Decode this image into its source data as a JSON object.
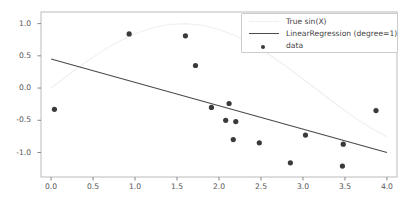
{
  "figure": {
    "top_artifact_text": "",
    "background": "#ffffff"
  },
  "legend": {
    "entries": [
      {
        "label": "True sin(X)",
        "marker": "line",
        "color": "#f2eef2"
      },
      {
        "label": "LinearRegression  (degree=1)",
        "marker": "line",
        "color": "#4a4a4a"
      },
      {
        "label": "data",
        "marker": "dot",
        "color": "#3a3a3a"
      }
    ]
  },
  "axes": {
    "xticks": [
      "0.0",
      "0.5",
      "1.0",
      "1.5",
      "2.0",
      "2.5",
      "3.0",
      "3.5",
      "4.0"
    ],
    "yticks": [
      "1.0",
      "0.5",
      "0.0",
      "-0.5",
      "-1.0"
    ],
    "xlabel": "",
    "ylabel": "",
    "spine_color": "#bbbbbb",
    "tick_color": "#888888"
  },
  "chart_data": {
    "type": "scatter",
    "title": "",
    "xlabel": "",
    "ylabel": "",
    "xlim": [
      -0.12,
      4.12
    ],
    "ylim": [
      -1.38,
      1.18
    ],
    "xticks": [
      0.0,
      0.5,
      1.0,
      1.5,
      2.0,
      2.5,
      3.0,
      3.5,
      4.0
    ],
    "yticks": [
      1.0,
      0.5,
      0.0,
      -0.5,
      -1.0
    ],
    "grid": false,
    "legend_position": "upper right",
    "series": [
      {
        "name": "True sin(X)",
        "type": "line",
        "color": "#f2eef2",
        "linewidth": 1.1,
        "x": [
          0.0,
          0.2,
          0.4,
          0.6,
          0.8,
          1.0,
          1.2,
          1.4,
          1.6,
          1.8,
          2.0,
          2.2,
          2.4,
          2.6,
          2.8,
          3.0,
          3.2,
          3.4,
          3.6,
          3.8,
          4.0
        ],
        "values": [
          0.0,
          0.199,
          0.389,
          0.565,
          0.717,
          0.841,
          0.932,
          0.985,
          1.0,
          0.974,
          0.909,
          0.808,
          0.675,
          0.516,
          0.335,
          0.141,
          -0.058,
          -0.256,
          -0.443,
          -0.612,
          -0.757
        ],
        "note": "sin(x) reference curve drawn very faint; visible portion spans x=0 to x=4 but rendered mostly as a light arc peaking near x=1.57 and dipping near x=3.0"
      },
      {
        "name": "LinearRegression  (degree=1)",
        "type": "line",
        "color": "#4a4a4a",
        "linewidth": 1.1,
        "x": [
          0.0,
          4.0
        ],
        "values": [
          0.45,
          -1.0
        ],
        "slope": -0.3625,
        "intercept": 0.45
      },
      {
        "name": "data",
        "type": "scatter",
        "color": "#3a3a3a",
        "marker": "o",
        "markersize": 5,
        "x": [
          0.04,
          0.93,
          1.6,
          1.72,
          1.91,
          2.08,
          2.12,
          2.17,
          2.2,
          2.48,
          2.85,
          3.03,
          3.47,
          3.48,
          3.87
        ],
        "values": [
          -0.33,
          0.84,
          0.81,
          0.35,
          -0.3,
          -0.5,
          -0.24,
          -0.8,
          -0.52,
          -0.85,
          -1.16,
          -0.73,
          -1.21,
          -0.87,
          -0.35
        ]
      }
    ]
  }
}
